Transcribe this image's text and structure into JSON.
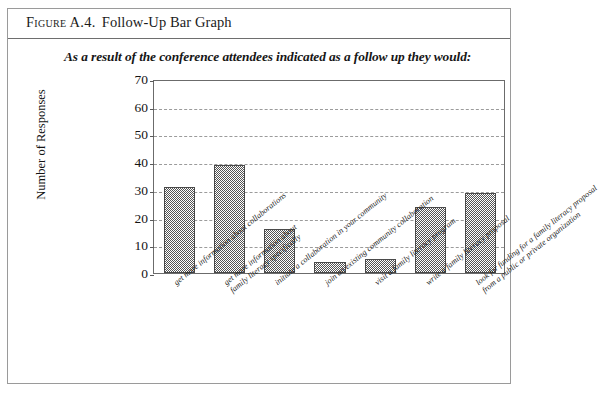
{
  "figure": {
    "label": "Figure A.4.",
    "title": "Follow-Up Bar Graph"
  },
  "chart_data": {
    "type": "bar",
    "title": "As a result of the conference attendees indicated as a follow up they would:",
    "xlabel": "",
    "ylabel": "Number of Responses",
    "ylim": [
      0,
      70
    ],
    "yticks": [
      0,
      10,
      20,
      30,
      40,
      50,
      60,
      70
    ],
    "grid": true,
    "legend": "none",
    "categories": [
      "get more information about collaborations",
      "get more information about family literacy specifically",
      "initiate a collaboration in your community",
      "join an existing community collaboration",
      "visit a family literacy program",
      "write a family literacy proposal",
      "look for funding for a family literacy proposal from a public or private organization"
    ],
    "category_lines": [
      [
        "get more information about collaborations"
      ],
      [
        "get more information about",
        "family literacy specifically"
      ],
      [
        "initiate a collaboration in your community"
      ],
      [
        "join an existing community collaboration"
      ],
      [
        "visit a family literacy program"
      ],
      [
        "write a family literacy proposal"
      ],
      [
        "look for funding for a family literacy proposal",
        "from a public or private organization"
      ]
    ],
    "values": [
      31,
      39,
      16,
      4,
      5,
      24,
      29
    ],
    "bar_fill": "#545454",
    "bar_edge": "#4a4a4a"
  }
}
